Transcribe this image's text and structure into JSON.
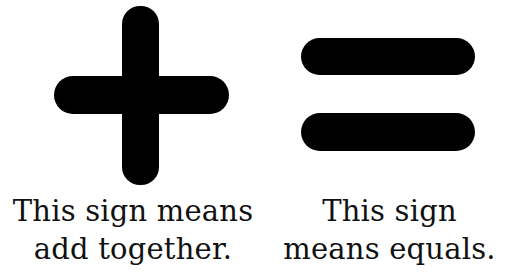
{
  "plus_panel": {
    "icon": "plus-sign-icon",
    "caption_lines": [
      "This sign means",
      "add together."
    ]
  },
  "equals_panel": {
    "icon": "equals-sign-icon",
    "caption_lines": [
      "This sign",
      "means equals."
    ]
  },
  "colors": {
    "symbol": "#000000",
    "text": "#111111",
    "background": "#ffffff"
  }
}
